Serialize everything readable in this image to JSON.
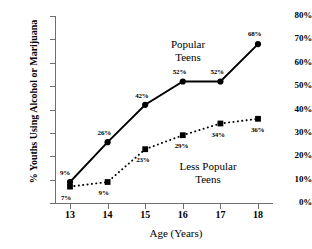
{
  "chart_data": {
    "type": "line",
    "title": "",
    "xlabel": "Age (Years)",
    "ylabel": "% Youths Using Alcohol or Marijuana",
    "x": [
      13,
      14,
      15,
      16,
      17,
      18
    ],
    "xtick_labels": [
      "13",
      "14",
      "15",
      "16",
      "17",
      "18"
    ],
    "ytick_labels": [
      "0%",
      "10%",
      "20%",
      "30%",
      "40%",
      "50%",
      "60%",
      "70%",
      "80%"
    ],
    "ytick_values": [
      0,
      10,
      20,
      30,
      40,
      50,
      60,
      70,
      80
    ],
    "ylim": [
      0,
      80
    ],
    "xlim": [
      12.6,
      18.4
    ],
    "grid": false,
    "legend": "inline-annotations",
    "series": [
      {
        "name": "Popular Teens",
        "marker": "circle",
        "line_style": "solid",
        "color": "#000000",
        "values": [
          9,
          26,
          42,
          52,
          52,
          68
        ],
        "point_labels": [
          "9%",
          "26%",
          "42%",
          "52%",
          "52%",
          "68%"
        ]
      },
      {
        "name": "Less Popular Teens",
        "marker": "square",
        "line_style": "dotted",
        "color": "#000000",
        "values": [
          7,
          9,
          23,
          29,
          34,
          36
        ],
        "point_labels": [
          "7%",
          "9%",
          "23%",
          "29%",
          "34%",
          "36%"
        ]
      }
    ],
    "annotations": [
      {
        "text_line1": "Popular",
        "text_line2": "Teens"
      },
      {
        "text_line1": "Less Popular",
        "text_line2": "Teens"
      }
    ]
  },
  "axis": {
    "y_title": "% Youths Using Alcohol or Marijuana",
    "x_title": "Age (Years)"
  },
  "annot": {
    "popular_1": "Popular",
    "popular_2": "Teens",
    "less_1": "Less Popular",
    "less_2": "Teens"
  },
  "colors": {
    "axis": "#6f6f6f",
    "series": "#000000",
    "background": "#ffffff"
  }
}
